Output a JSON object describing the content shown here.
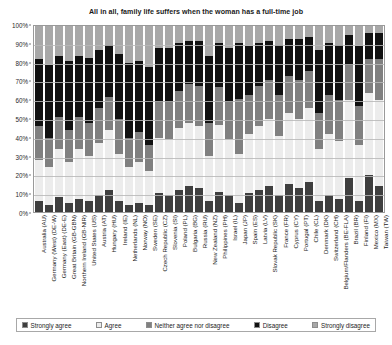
{
  "chart_data": {
    "type": "bar",
    "subtype": "stacked-100-percent-horizontal-categories",
    "title": "All in all, family life suffers when the woman has a full-time job",
    "xlabel": "",
    "ylabel": "",
    "ylim": [
      0,
      100
    ],
    "yticks": [
      "0%",
      "10%",
      "20%",
      "30%",
      "40%",
      "50%",
      "60%",
      "70%",
      "80%",
      "90%",
      "100%"
    ],
    "grid": true,
    "legend_position": "bottom",
    "stack_order_bottom_to_top": [
      "Strongly agree",
      "Agree",
      "Neither agree nor disagree",
      "Disagree",
      "Strongly disagree"
    ],
    "categories": [
      "Australia (AU)",
      "Germany (West) (DE-W)",
      "Germany (East) (DE-E)",
      "Great Britain (GB-GBN)",
      "Northern Ireland (GB-NIR)",
      "United States (US)",
      "Austria (AT)",
      "Hungary (HU)",
      "Ireland (IE)",
      "Netherlands (NL)",
      "Norway (NO)",
      "Sweden (SE)",
      "Czech Republic (CZ)",
      "Slovenia (SI)",
      "Poland (PL)",
      "Bulgaria (BG)",
      "Russia (RU)",
      "New Zealand (NZ)",
      "Philippines (PH)",
      "Israel (IL)",
      "Japan (JP)",
      "Spain (ES)",
      "Latvia (LV)",
      "Slovak Republic (SK)",
      "France (FR)",
      "Cyprus (CY)",
      "Portugal (PT)",
      "Chile (CL)",
      "Denmark (DK)",
      "Switzerland (CH)",
      "Belgium/Flanders (BE-FLA)",
      "Brazil (BR)",
      "Finland (FI)",
      "Mexico (MX)",
      "Taiwan (TW)"
    ],
    "series": [
      {
        "name": "Strongly agree",
        "color": "#3f3f3f",
        "values": [
          6,
          4,
          8,
          5,
          7,
          6,
          9,
          12,
          6,
          4,
          5,
          4,
          10,
          9,
          12,
          14,
          13,
          6,
          11,
          9,
          5,
          10,
          12,
          14,
          9,
          15,
          13,
          16,
          6,
          9,
          7,
          18,
          6,
          20,
          14
        ]
      },
      {
        "name": "Agree",
        "color": "#ececec",
        "values": [
          22,
          20,
          26,
          22,
          27,
          24,
          28,
          32,
          25,
          20,
          22,
          18,
          30,
          30,
          33,
          34,
          33,
          24,
          36,
          30,
          26,
          32,
          34,
          36,
          32,
          38,
          37,
          40,
          28,
          33,
          31,
          42,
          30,
          44,
          46
        ]
      },
      {
        "name": "Neither agree nor disagree",
        "color": "#808080",
        "values": [
          18,
          16,
          17,
          17,
          17,
          18,
          19,
          18,
          19,
          16,
          16,
          14,
          19,
          20,
          20,
          21,
          22,
          18,
          20,
          20,
          30,
          21,
          22,
          21,
          22,
          20,
          21,
          20,
          19,
          21,
          22,
          19,
          21,
          18,
          22
        ]
      },
      {
        "name": "Disagree",
        "color": "#111111",
        "values": [
          36,
          39,
          33,
          37,
          33,
          35,
          31,
          28,
          35,
          40,
          38,
          42,
          29,
          29,
          26,
          23,
          24,
          36,
          24,
          29,
          30,
          26,
          23,
          21,
          27,
          20,
          22,
          18,
          34,
          28,
          30,
          16,
          32,
          14,
          14
        ]
      },
      {
        "name": "Strongly disagree",
        "color": "#a8a8a8",
        "values": [
          18,
          21,
          16,
          19,
          16,
          17,
          13,
          10,
          15,
          20,
          19,
          22,
          12,
          12,
          9,
          8,
          8,
          16,
          9,
          12,
          9,
          11,
          9,
          8,
          10,
          7,
          7,
          6,
          13,
          9,
          10,
          5,
          11,
          4,
          4
        ]
      }
    ]
  },
  "legend": {
    "items": [
      {
        "label": "Strongly agree",
        "color": "#3f3f3f"
      },
      {
        "label": "Agree",
        "color": "#ececec"
      },
      {
        "label": "Neither agree nor disagree",
        "color": "#808080"
      },
      {
        "label": "Disagree",
        "color": "#111111"
      },
      {
        "label": "Strongly disagree",
        "color": "#a8a8a8"
      }
    ]
  }
}
